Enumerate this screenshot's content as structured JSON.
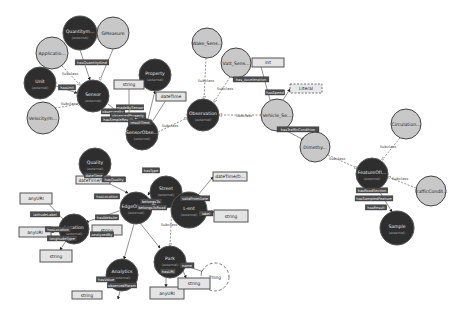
{
  "diagram": {
    "type": "ontology-graph",
    "classes": [
      {
        "id": "quantity",
        "label": "Quantitym...",
        "sub": "(external)",
        "x": 80,
        "y": 33,
        "r": 17,
        "style": "dark"
      },
      {
        "id": "gmeasure",
        "label": "GMeasure",
        "sub": "",
        "x": 113,
        "y": 33,
        "r": 16,
        "style": "light"
      },
      {
        "id": "appdata",
        "label": "Applicatio...",
        "sub": "",
        "x": 52,
        "y": 53,
        "r": 16,
        "style": "light"
      },
      {
        "id": "unit",
        "label": "Unit",
        "sub": "(external)",
        "x": 40,
        "y": 83,
        "r": 16,
        "style": "dark"
      },
      {
        "id": "sensor",
        "label": "Sensor",
        "sub": "(external)",
        "x": 93,
        "y": 96,
        "r": 16,
        "style": "dark"
      },
      {
        "id": "velocity",
        "label": "Velocity/m...",
        "sub": "",
        "x": 43,
        "y": 118,
        "r": 16,
        "style": "light"
      },
      {
        "id": "property",
        "label": "Property",
        "sub": "(external)",
        "x": 155,
        "y": 75,
        "r": 16,
        "style": "dark"
      },
      {
        "id": "sensorobs",
        "label": "SensorObse...",
        "sub": "(external)",
        "x": 142,
        "y": 134,
        "r": 16,
        "style": "dark"
      },
      {
        "id": "wake",
        "label": "Wake_Sens...",
        "sub": "",
        "x": 207,
        "y": 43,
        "r": 15,
        "style": "light"
      },
      {
        "id": "vatsense",
        "label": "Vatt_Sens...",
        "sub": "",
        "x": 236,
        "y": 63,
        "r": 15,
        "style": "light"
      },
      {
        "id": "observation",
        "label": "Observation",
        "sub": "(external)",
        "x": 203,
        "y": 115,
        "r": 16,
        "style": "dark"
      },
      {
        "id": "vehicle",
        "label": "Vehicle_Se...",
        "sub": "",
        "x": 277,
        "y": 115,
        "r": 16,
        "style": "light"
      },
      {
        "id": "dimethy",
        "label": "Dimethy...",
        "sub": "",
        "x": 315,
        "y": 147,
        "r": 15,
        "style": "light"
      },
      {
        "id": "circulation",
        "label": "Circulation...",
        "sub": "",
        "x": 406,
        "y": 124,
        "r": 15,
        "style": "light"
      },
      {
        "id": "featureof",
        "label": "FeatureOfI...",
        "sub": "(external)",
        "x": 372,
        "y": 174,
        "r": 16,
        "style": "dark"
      },
      {
        "id": "trafficcond",
        "label": "TrafficCondit...",
        "sub": "",
        "x": 431,
        "y": 191,
        "r": 15,
        "style": "light"
      },
      {
        "id": "sample",
        "label": "Sample",
        "sub": "(external)",
        "x": 397,
        "y": 228,
        "r": 17,
        "style": "dark"
      },
      {
        "id": "quality",
        "label": "Quality",
        "sub": "(external)",
        "x": 95,
        "y": 164,
        "r": 16,
        "style": "dark"
      },
      {
        "id": "edgeobs",
        "label": "EdgeObser...",
        "sub": "(external)",
        "x": 136,
        "y": 208,
        "r": 16,
        "style": "dark"
      },
      {
        "id": "street",
        "label": "Street",
        "sub": "(external)",
        "x": 166,
        "y": 192,
        "r": 16,
        "style": "dark"
      },
      {
        "id": "event",
        "label": "L-ent",
        "sub": "(external)",
        "x": 189,
        "y": 210,
        "r": 18,
        "style": "dark"
      },
      {
        "id": "location",
        "label": "Location",
        "sub": "(external)",
        "x": 74,
        "y": 229,
        "r": 15,
        "style": "dark"
      },
      {
        "id": "analytics",
        "label": "Analytics",
        "sub": "(external)",
        "x": 122,
        "y": 275,
        "r": 16,
        "style": "dark"
      },
      {
        "id": "park",
        "label": "Park",
        "sub": "(external)",
        "x": 170,
        "y": 262,
        "r": 16,
        "style": "dark"
      }
    ],
    "datatypes": [
      {
        "id": "dt_string_top",
        "label": "string",
        "x": 114,
        "y": 80,
        "w": 30,
        "h": 9
      },
      {
        "id": "dt_datetime_top",
        "label": "dateTime",
        "x": 156,
        "y": 92,
        "w": 30,
        "h": 9
      },
      {
        "id": "dt_int",
        "label": "int",
        "x": 252,
        "y": 58,
        "w": 32,
        "h": 9
      },
      {
        "id": "dt_literal",
        "label": "Literal",
        "x": 290,
        "y": 84,
        "w": 32,
        "h": 9,
        "dashed": true
      },
      {
        "id": "dt_datetime_q",
        "label": "dateTime/S...",
        "x": 76,
        "y": 176,
        "w": 34,
        "h": 8
      },
      {
        "id": "dt_datetime_r",
        "label": "dateTime/D...",
        "x": 213,
        "y": 172,
        "w": 34,
        "h": 9
      },
      {
        "id": "dt_string_r",
        "label": "string",
        "x": 214,
        "y": 210,
        "w": 34,
        "h": 12
      },
      {
        "id": "dt_anyuri_1",
        "label": "anyURI",
        "x": 20,
        "y": 193,
        "w": 32,
        "h": 11
      },
      {
        "id": "dt_anyuri_2",
        "label": "anyURI",
        "x": 19,
        "y": 227,
        "w": 32,
        "h": 10
      },
      {
        "id": "dt_string_l",
        "label": "string",
        "x": 40,
        "y": 250,
        "w": 32,
        "h": 12
      },
      {
        "id": "dt_string_m",
        "label": "string",
        "x": 92,
        "y": 225,
        "w": 30,
        "h": 10
      },
      {
        "id": "dt_anyuri_p",
        "label": "anyURI",
        "x": 150,
        "y": 287,
        "w": 34,
        "h": 12
      },
      {
        "id": "dt_string_p",
        "label": "string",
        "x": 178,
        "y": 278,
        "w": 32,
        "h": 11
      },
      {
        "id": "dt_string_a",
        "label": "string",
        "x": 72,
        "y": 291,
        "w": 30,
        "h": 8
      }
    ],
    "thing": {
      "label": "Thing",
      "x": 215,
      "y": 277,
      "r": 14
    },
    "subclass_label": "Subclass",
    "properties": [
      {
        "label": "hasQuantityKind",
        "x": 92,
        "y": 63
      },
      {
        "label": "hasUnit",
        "x": 67,
        "y": 88
      },
      {
        "label": "observedBy",
        "x": 113,
        "y": 112
      },
      {
        "label": "madeBySensor",
        "x": 130,
        "y": 108
      },
      {
        "label": "observedProperty",
        "x": 128,
        "y": 116
      },
      {
        "label": "hasSimpleResult",
        "x": 118,
        "y": 120
      },
      {
        "label": "resultTime",
        "x": 140,
        "y": 123
      },
      {
        "label": "has_Acceleration",
        "x": 251,
        "y": 80
      },
      {
        "label": "hasSpeed",
        "x": 275,
        "y": 93
      },
      {
        "label": "hasTrafficCondition",
        "x": 298,
        "y": 130
      },
      {
        "label": "hasRoadSection",
        "x": 372,
        "y": 191
      },
      {
        "label": "hasSampledFeature",
        "x": 374,
        "y": 199
      },
      {
        "label": "hasResult",
        "x": 376,
        "y": 208
      },
      {
        "label": "dateTime",
        "x": 94,
        "y": 176
      },
      {
        "label": "hasQuality",
        "x": 114,
        "y": 180
      },
      {
        "label": "hasLocation",
        "x": 107,
        "y": 197
      },
      {
        "label": "hasType",
        "x": 151,
        "y": 171
      },
      {
        "label": "belongsTo",
        "x": 151,
        "y": 202
      },
      {
        "label": "belongsToRoad",
        "x": 152,
        "y": 208
      },
      {
        "label": "validFromDate",
        "x": 195,
        "y": 199
      },
      {
        "label": "label",
        "x": 206,
        "y": 214
      },
      {
        "label": "latitudeLabel",
        "x": 45,
        "y": 215
      },
      {
        "label": "hasLocation",
        "x": 58,
        "y": 230
      },
      {
        "label": "longitudeType",
        "x": 62,
        "y": 239
      },
      {
        "label": "hasWebsite",
        "x": 107,
        "y": 218
      },
      {
        "label": "analyzedBy",
        "x": 102,
        "y": 235
      },
      {
        "label": "hasValue",
        "x": 106,
        "y": 280
      },
      {
        "label": "observedParam",
        "x": 122,
        "y": 286
      },
      {
        "label": "hasURI",
        "x": 168,
        "y": 272
      },
      {
        "label": "name",
        "x": 187,
        "y": 266
      }
    ]
  }
}
